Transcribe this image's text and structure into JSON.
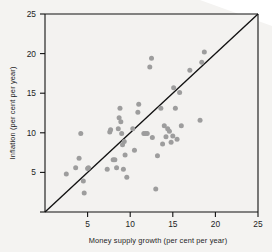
{
  "figure": {
    "name": "money-growth-inflation-scatter",
    "background_color": "#f3f2f0",
    "point_color": "#9d9d9d",
    "line_color": "#111111"
  },
  "chart_data": {
    "type": "scatter",
    "title": "",
    "xlabel": "Money supply growth (per cent per year)",
    "ylabel": "Inflation (per cent per year)",
    "xlim": [
      0,
      25
    ],
    "ylim": [
      0,
      25
    ],
    "xticks": [
      5,
      10,
      15,
      20,
      25
    ],
    "yticks": [
      5,
      10,
      15,
      20,
      25
    ],
    "xtick_labels": [
      "5",
      "10",
      "15",
      "20",
      "25"
    ],
    "ytick_labels": [
      "5",
      "10",
      "15",
      "20",
      "25"
    ],
    "grid": false,
    "legend": null,
    "annotations": [
      {
        "name": "forty-five-degree-line",
        "type": "line",
        "label": "45 degree line",
        "from": [
          0,
          0
        ],
        "to": [
          25,
          25
        ]
      }
    ],
    "series": [
      {
        "name": "countries",
        "marker": "circle",
        "color": "#9d9d9d",
        "points": [
          [
            2.5,
            4.8
          ],
          [
            3.6,
            5.6
          ],
          [
            4.0,
            6.8
          ],
          [
            4.2,
            9.9
          ],
          [
            4.5,
            3.9
          ],
          [
            4.6,
            2.4
          ],
          [
            5.0,
            5.5
          ],
          [
            5.1,
            5.6
          ],
          [
            7.3,
            5.4
          ],
          [
            7.6,
            10.1
          ],
          [
            7.7,
            10.4
          ],
          [
            8.0,
            6.6
          ],
          [
            8.2,
            6.6
          ],
          [
            8.4,
            5.6
          ],
          [
            8.6,
            10.5
          ],
          [
            8.7,
            11.9
          ],
          [
            8.8,
            13.1
          ],
          [
            8.9,
            11.4
          ],
          [
            9.0,
            9.9
          ],
          [
            9.1,
            8.5
          ],
          [
            9.2,
            5.4
          ],
          [
            9.3,
            8.9
          ],
          [
            9.4,
            7.2
          ],
          [
            9.6,
            4.4
          ],
          [
            10.3,
            10.5
          ],
          [
            10.5,
            7.8
          ],
          [
            10.9,
            12.6
          ],
          [
            11.0,
            13.6
          ],
          [
            11.6,
            9.9
          ],
          [
            11.8,
            9.9
          ],
          [
            12.0,
            9.9
          ],
          [
            12.3,
            18.3
          ],
          [
            12.5,
            19.4
          ],
          [
            12.6,
            9.4
          ],
          [
            13.0,
            2.9
          ],
          [
            13.2,
            7.1
          ],
          [
            13.6,
            13.1
          ],
          [
            13.8,
            8.6
          ],
          [
            14.0,
            10.9
          ],
          [
            14.2,
            9.5
          ],
          [
            14.4,
            10.5
          ],
          [
            14.6,
            10.2
          ],
          [
            14.8,
            8.8
          ],
          [
            15.0,
            9.6
          ],
          [
            15.1,
            15.7
          ],
          [
            15.3,
            13.1
          ],
          [
            15.5,
            9.2
          ],
          [
            15.8,
            15.1
          ],
          [
            16.0,
            10.9
          ],
          [
            17.0,
            17.9
          ],
          [
            18.2,
            11.6
          ],
          [
            18.4,
            18.9
          ],
          [
            18.7,
            20.2
          ]
        ]
      }
    ]
  }
}
